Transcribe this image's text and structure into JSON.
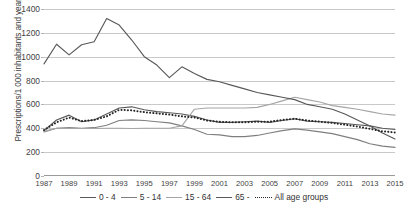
{
  "axes": {
    "y_title": "Prescriptions/1 000 inhabitants and year",
    "y_ticks": [
      "1400",
      "1200",
      "1000",
      "800",
      "600",
      "400",
      "200",
      "0"
    ],
    "x_ticks": [
      "1987",
      "1989",
      "1991",
      "1993",
      "1995",
      "1997",
      "1999",
      "2001",
      "2003",
      "2005",
      "2007",
      "2009",
      "2011",
      "2013",
      "2015"
    ]
  },
  "legend": {
    "items": [
      {
        "label": "0 - 4",
        "style": "solid",
        "color": "#595959"
      },
      {
        "label": "5 - 14",
        "style": "solid",
        "color": "#7f7f7f"
      },
      {
        "label": "15 - 64",
        "style": "solid",
        "color": "#a6a6a6"
      },
      {
        "label": "65 -",
        "style": "solid",
        "color": "#595959"
      },
      {
        "label": "All age groups",
        "style": "dotted",
        "color": "#262626"
      }
    ]
  },
  "chart_data": {
    "type": "line",
    "title": "",
    "xlabel": "",
    "ylabel": "Prescriptions/1 000 inhabitants and year",
    "ylim": [
      0,
      1400
    ],
    "y_tick_step": 200,
    "grid": true,
    "legend_position": "bottom",
    "x": [
      1987,
      1988,
      1989,
      1990,
      1991,
      1992,
      1993,
      1994,
      1995,
      1996,
      1997,
      1998,
      1999,
      2000,
      2001,
      2002,
      2003,
      2004,
      2005,
      2006,
      2007,
      2008,
      2009,
      2010,
      2011,
      2012,
      2013,
      2014,
      2015
    ],
    "series": [
      {
        "name": "0 - 4",
        "color": "#595959",
        "style": "solid",
        "values": [
          380,
          470,
          510,
          455,
          470,
          520,
          570,
          580,
          555,
          540,
          530,
          520,
          500,
          470,
          450,
          450,
          455,
          460,
          450,
          465,
          480,
          460,
          455,
          450,
          440,
          430,
          420,
          400,
          390
        ]
      },
      {
        "name": "5 - 14",
        "color": "#7f7f7f",
        "style": "solid",
        "values": [
          370,
          400,
          405,
          400,
          405,
          425,
          465,
          470,
          465,
          455,
          445,
          420,
          390,
          350,
          345,
          330,
          330,
          340,
          360,
          380,
          395,
          385,
          370,
          355,
          330,
          305,
          270,
          250,
          240
        ]
      },
      {
        "name": "15 - 64",
        "color": "#a6a6a6",
        "style": "solid",
        "values": [
          375,
          400,
          400,
          398,
          398,
          400,
          400,
          398,
          400,
          400,
          400,
          420,
          560,
          570,
          570,
          570,
          570,
          575,
          600,
          630,
          660,
          640,
          620,
          590,
          575,
          560,
          540,
          520,
          510
        ]
      },
      {
        "name": "65 -",
        "color": "#595959",
        "style": "solid",
        "values": [
          940,
          1105,
          1015,
          1100,
          1125,
          1320,
          1265,
          1140,
          1000,
          930,
          825,
          915,
          860,
          810,
          790,
          760,
          730,
          700,
          680,
          660,
          640,
          600,
          580,
          560,
          520,
          470,
          420,
          360,
          310
        ]
      },
      {
        "name": "All age groups",
        "color": "#262626",
        "style": "dotted",
        "values": [
          385,
          450,
          490,
          460,
          470,
          500,
          555,
          550,
          535,
          525,
          515,
          500,
          490,
          465,
          455,
          450,
          450,
          455,
          455,
          470,
          480,
          465,
          455,
          445,
          430,
          415,
          395,
          375,
          365
        ]
      }
    ]
  }
}
